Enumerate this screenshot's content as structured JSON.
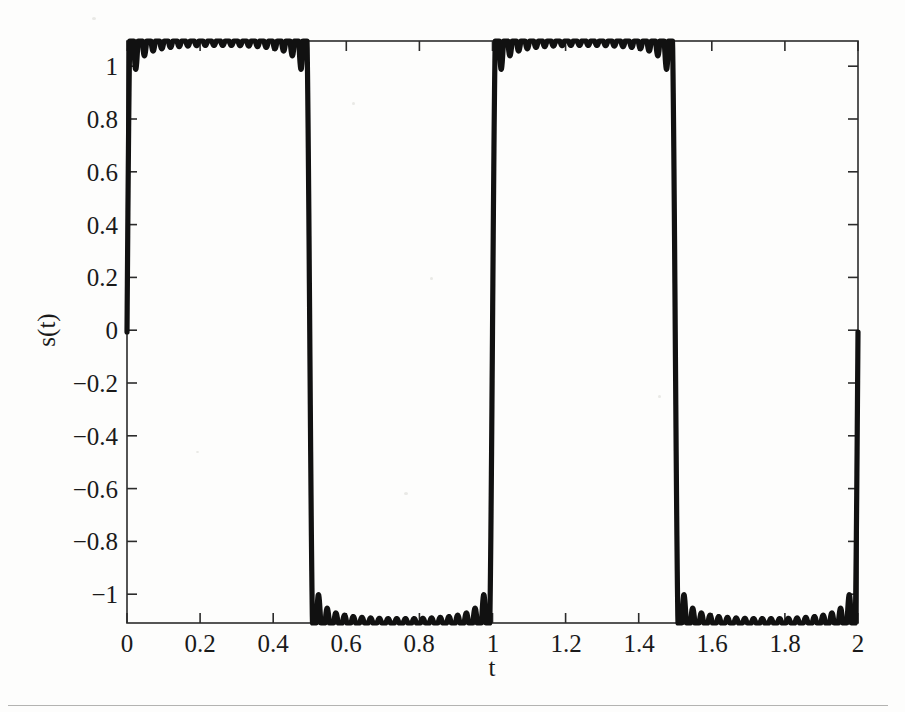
{
  "figure": {
    "background_color": "#fdfdfc",
    "line_color": "#111111",
    "axis_color": "#2b2b2b"
  },
  "axes": {
    "x_title": "t",
    "y_title": "s(t)",
    "x_ticks": [
      "0",
      "0.2",
      "0.4",
      "0.6",
      "0.8",
      "1",
      "1.2",
      "1.4",
      "1.6",
      "1.8",
      "2"
    ],
    "y_ticks": [
      "1",
      "0.8",
      "0.6",
      "0.4",
      "0.2",
      "0",
      "−0.2",
      "−0.4",
      "−0.6",
      "−0.8",
      "−1"
    ]
  },
  "chart_data": {
    "type": "line",
    "title": "",
    "subtitle": "",
    "xlabel": "t",
    "ylabel": "s(t)",
    "xlim": [
      0,
      2
    ],
    "ylim": [
      -1,
      1
    ],
    "xticks": [
      0,
      0.2,
      0.4,
      0.6,
      0.8,
      1,
      1.2,
      1.4,
      1.6,
      1.8,
      2
    ],
    "yticks": [
      1,
      0.8,
      0.6,
      0.4,
      0.2,
      0,
      -0.2,
      -0.4,
      -0.6,
      -0.8,
      -1
    ],
    "grid": false,
    "legend": false,
    "legend_position": "none",
    "annotations": [],
    "series": [
      {
        "name": "s(t)",
        "description": "Square wave, period 1 s, 50% duty cycle, amplitude 1, rendered as a smoothed/band-limited square wave with rounded transition corners",
        "waveform": "square",
        "period": 1.0,
        "frequency_hz": 1.0,
        "amplitude": 1.0,
        "duty_cycle": 0.5,
        "high_level": 1,
        "low_level": -1,
        "transition_times": [
          0.0,
          0.5,
          1.0,
          1.5,
          2.0
        ],
        "segments": [
          {
            "t_start": 0.0,
            "t_end": 0.5,
            "value": 1
          },
          {
            "t_start": 0.5,
            "t_end": 1.0,
            "value": -1
          },
          {
            "t_start": 1.0,
            "t_end": 1.5,
            "value": 1
          },
          {
            "t_start": 1.5,
            "t_end": 2.0,
            "value": -1
          }
        ],
        "x": [
          0,
          0.01,
          0.02,
          0.05,
          0.1,
          0.2,
          0.3,
          0.4,
          0.48,
          0.49,
          0.5,
          0.51,
          0.52,
          0.55,
          0.6,
          0.7,
          0.8,
          0.9,
          0.98,
          0.99,
          1.0,
          1.01,
          1.02,
          1.05,
          1.1,
          1.2,
          1.3,
          1.4,
          1.48,
          1.49,
          1.5,
          1.51,
          1.52,
          1.55,
          1.6,
          1.7,
          1.8,
          1.9,
          1.98,
          1.99,
          2.0
        ],
        "y": [
          0,
          0.55,
          0.85,
          0.97,
          0.99,
          1,
          1,
          1,
          0.99,
          0.9,
          0,
          -0.9,
          -0.99,
          -1,
          -1,
          -1,
          -1,
          -1,
          -0.99,
          -0.9,
          0,
          0.9,
          0.99,
          1,
          1,
          1,
          1,
          1,
          0.99,
          0.9,
          0,
          -0.9,
          -0.99,
          -1,
          -1,
          -1,
          -1,
          -1,
          -0.99,
          -0.9,
          0
        ]
      }
    ]
  }
}
